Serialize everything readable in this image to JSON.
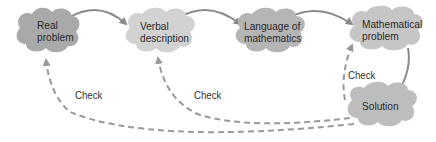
{
  "nodes": [
    {
      "id": "real",
      "line1": "Real",
      "line2": "problem",
      "fill": "#a9a9a9"
    },
    {
      "id": "verbal",
      "line1": "Verbal",
      "line2": "description",
      "fill": "#d2d2d2"
    },
    {
      "id": "language",
      "line1": "Language of",
      "line2": "mathematics",
      "fill": "#b5b5b5"
    },
    {
      "id": "math",
      "line1": "Mathematical",
      "line2": "problem",
      "fill": "#c6c6c6"
    },
    {
      "id": "solution",
      "line1": "Solution",
      "line2": "",
      "fill": "#bdbdbd"
    }
  ],
  "edges": {
    "solid_color": "#8a8a8a",
    "dashed_color": "#999999"
  },
  "check_labels": [
    "Check",
    "Check",
    "Check"
  ]
}
